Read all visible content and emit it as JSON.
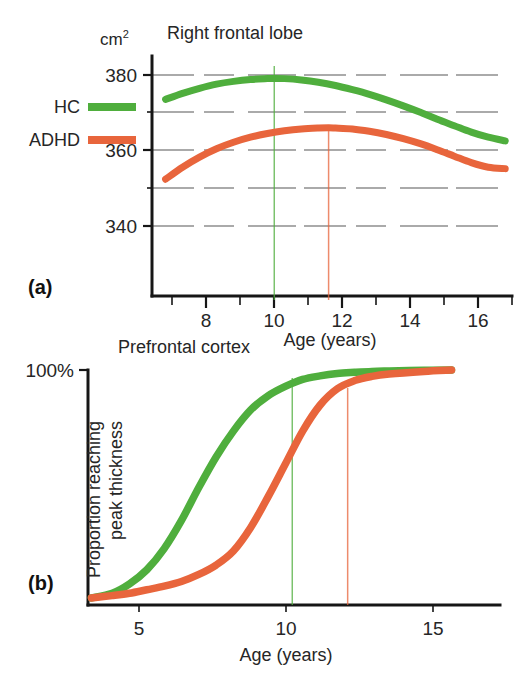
{
  "figure": {
    "panels": [
      {
        "key": "a",
        "panel_label": "(a)",
        "title": "Right frontal lobe",
        "y_unit": "cm",
        "y_unit_sup": "2",
        "x_axis_title": "Age (years)"
      },
      {
        "key": "b",
        "panel_label": "(b)",
        "title": "Prefrontal cortex",
        "y_top_label": "100%",
        "y_axis_title_line1": "Proportion reaching",
        "y_axis_title_line2": "peak thickness",
        "x_axis_title": "Age (years)"
      }
    ],
    "legend": {
      "position": "left-middle",
      "entries": [
        {
          "label": "HC",
          "color": "#4fae3d"
        },
        {
          "label": "ADHD",
          "color": "#e8653c"
        }
      ]
    },
    "colors": {
      "hc_green": "#4fae3d",
      "adhd_orange": "#e8653c",
      "axis": "#161616",
      "grid": "#3a3a3a",
      "background": "#ffffff"
    }
  },
  "chart_data": [
    {
      "type": "line",
      "panel": "a",
      "title": "Right frontal lobe",
      "xlabel": "Age (years)",
      "ylabel": "cm2",
      "xlim": [
        6.6,
        17.2
      ],
      "ylim": [
        332,
        384
      ],
      "grid": true,
      "y_ticks_labeled": [
        340,
        360,
        380
      ],
      "y_gridlines": [
        340,
        350,
        360,
        370,
        380
      ],
      "x_ticks_labeled": [
        8,
        10,
        12,
        14,
        16
      ],
      "x_ticks_minor": [
        7,
        9,
        11,
        13,
        15,
        17
      ],
      "legend_position": "left",
      "annotations": [
        {
          "type": "vline",
          "x": 10.2,
          "color": "#4fae3d",
          "label": "HC peak age"
        },
        {
          "type": "vline",
          "x": 11.8,
          "color": "#e8653c",
          "label": "ADHD peak age"
        }
      ],
      "series": [
        {
          "name": "HC",
          "color": "#4fae3d",
          "x": [
            7.0,
            7.5,
            8.0,
            8.5,
            9.0,
            9.5,
            10.0,
            10.2,
            10.5,
            11.0,
            11.5,
            12.0,
            12.5,
            13.0,
            13.5,
            14.0,
            14.5,
            15.0,
            15.5,
            16.0,
            16.5,
            17.0
          ],
          "values": [
            374.6,
            375.9,
            377.0,
            377.9,
            378.5,
            378.9,
            379.1,
            379.15,
            379.1,
            378.8,
            378.3,
            377.6,
            376.7,
            375.7,
            374.5,
            373.2,
            371.8,
            370.3,
            368.9,
            367.5,
            366.4,
            365.6
          ]
        },
        {
          "name": "ADHD",
          "color": "#e8653c",
          "x": [
            7.0,
            7.5,
            8.0,
            8.5,
            9.0,
            9.5,
            10.0,
            10.5,
            11.0,
            11.5,
            11.8,
            12.0,
            12.5,
            13.0,
            13.5,
            14.0,
            14.5,
            15.0,
            15.5,
            16.0,
            16.5,
            17.0
          ],
          "values": [
            357.3,
            359.9,
            362.1,
            363.9,
            365.3,
            366.4,
            367.2,
            367.8,
            368.2,
            368.4,
            368.45,
            368.4,
            368.2,
            367.7,
            367.0,
            366.1,
            365.0,
            363.7,
            362.3,
            360.9,
            359.9,
            359.6
          ]
        }
      ]
    },
    {
      "type": "line",
      "panel": "b",
      "title": "Prefrontal cortex",
      "xlabel": "Age (years)",
      "ylabel": "Proportion reaching peak thickness",
      "xlim": [
        4.3,
        16.2
      ],
      "ylim": [
        0,
        100
      ],
      "yunit": "%",
      "grid": false,
      "y_ticks_labeled": [
        100
      ],
      "x_ticks_labeled": [
        5,
        10,
        15
      ],
      "annotations": [
        {
          "type": "vline",
          "x": 10.2,
          "color": "#4fae3d",
          "label": "HC median age"
        },
        {
          "type": "vline",
          "x": 11.8,
          "color": "#e8653c",
          "label": "ADHD median age"
        }
      ],
      "series": [
        {
          "name": "HC",
          "color": "#4fae3d",
          "x": [
            4.4,
            5.0,
            5.5,
            6.0,
            6.5,
            7.0,
            7.5,
            8.0,
            8.5,
            9.0,
            9.5,
            10.0,
            10.5,
            11.0,
            11.5,
            12.0,
            12.5,
            13.0,
            14.0,
            14.8
          ],
          "values": [
            3,
            5,
            9,
            15,
            24,
            36,
            50,
            63,
            74,
            83,
            89,
            93,
            96,
            97.5,
            98.5,
            99,
            99.4,
            99.6,
            99.9,
            100
          ]
        },
        {
          "name": "ADHD",
          "color": "#e8653c",
          "x": [
            4.4,
            5.0,
            5.5,
            6.0,
            6.5,
            7.0,
            7.5,
            8.0,
            8.5,
            9.0,
            9.5,
            10.0,
            10.5,
            11.0,
            11.5,
            12.0,
            12.5,
            13.0,
            14.0,
            14.8
          ],
          "values": [
            3,
            4,
            5,
            6.5,
            8,
            10,
            13,
            17,
            23,
            33,
            46,
            60,
            74,
            85,
            92,
            95.5,
            97.3,
            98.3,
            99.4,
            100
          ]
        }
      ]
    }
  ]
}
